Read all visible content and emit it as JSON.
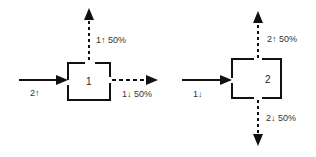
{
  "diagram": {
    "left": {
      "node_label": "1",
      "input_label": "2↑",
      "output_up_label": "1↑ 50%",
      "output_right_label": "1↓ 50%"
    },
    "right": {
      "node_label": "2",
      "input_label": "1↓",
      "output_up_label": "2↑ 50%",
      "output_down_label": "2↓ 50%"
    },
    "colors": {
      "stroke": "#111111",
      "text": "#333333",
      "background": "#ffffff"
    }
  }
}
